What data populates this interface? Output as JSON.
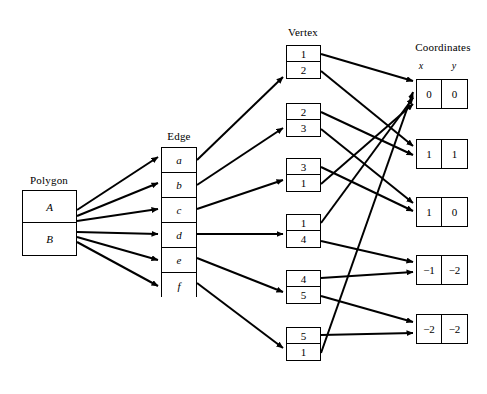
{
  "diagram": {
    "columns": {
      "polygon": {
        "title": "Polygon",
        "rows": [
          {
            "label": "A"
          },
          {
            "label": "B"
          }
        ]
      },
      "edge": {
        "title": "Edge",
        "rows": [
          {
            "label": "a"
          },
          {
            "label": "b"
          },
          {
            "label": "c"
          },
          {
            "label": "d"
          },
          {
            "label": "e"
          },
          {
            "label": "f"
          }
        ]
      },
      "vertex": {
        "title": "Vertex",
        "boxes": [
          {
            "top": "1",
            "bottom": "2"
          },
          {
            "top": "2",
            "bottom": "3"
          },
          {
            "top": "3",
            "bottom": "1"
          },
          {
            "top": "1",
            "bottom": "4"
          },
          {
            "top": "4",
            "bottom": "5"
          },
          {
            "top": "5",
            "bottom": "1"
          }
        ]
      },
      "coordinates": {
        "title": "Coordinates",
        "header": {
          "x": "x",
          "y": "y"
        },
        "boxes": [
          {
            "x": "0",
            "y": "0"
          },
          {
            "x": "1",
            "y": "1"
          },
          {
            "x": "1",
            "y": "0"
          },
          {
            "x": "−1",
            "y": "−2"
          },
          {
            "x": "−2",
            "y": "−2"
          }
        ]
      }
    },
    "colors": {
      "stroke": "#000000",
      "background": "#ffffff",
      "text": "#000000"
    }
  }
}
